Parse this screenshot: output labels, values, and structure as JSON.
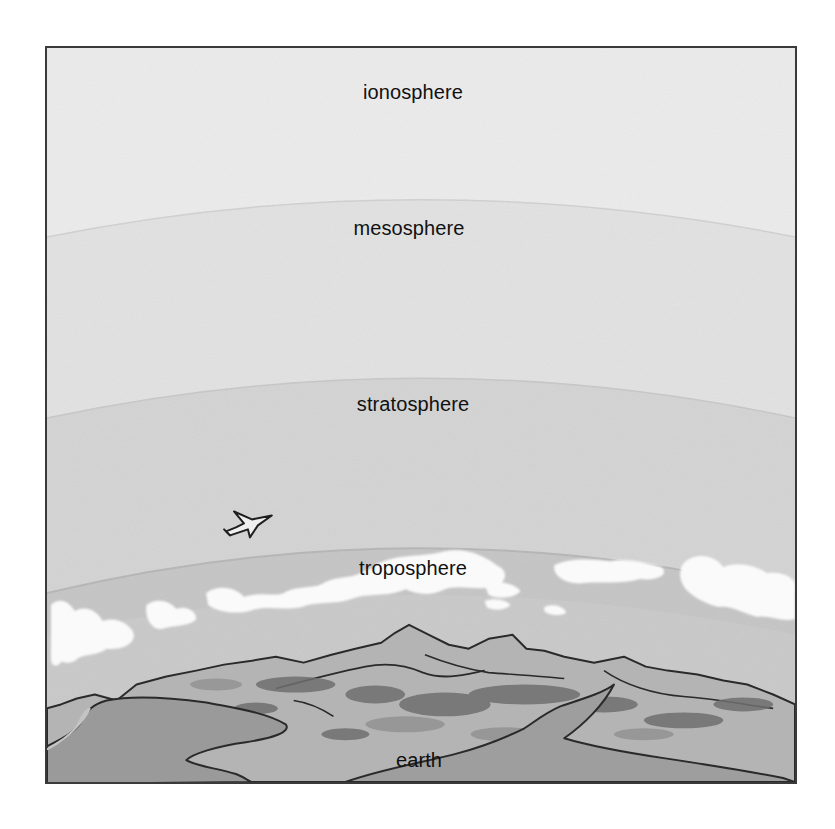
{
  "diagram": {
    "type": "atmosphere-layers",
    "layers": [
      {
        "id": "ionosphere",
        "label": "ionosphere",
        "fill": "#ececec"
      },
      {
        "id": "mesosphere",
        "label": "mesosphere",
        "fill": "#e2e2e2"
      },
      {
        "id": "stratosphere",
        "label": "stratosphere",
        "fill": "#d4d4d4"
      },
      {
        "id": "troposphere",
        "label": "troposphere",
        "fill": "#c6c6c6"
      },
      {
        "id": "earth",
        "label": "earth",
        "fill": "#a8a8a8"
      }
    ],
    "icons": {
      "airplane": "airplane-icon",
      "clouds": "cloud-band",
      "mountains": "mountain-range"
    },
    "colors": {
      "frame_border": "#3a3a3a",
      "text": "#111111",
      "cloud": "#fafafa",
      "water": "#9a9a9a",
      "land": "#bdbdbd",
      "land_dark": "#6e6e6e"
    }
  }
}
